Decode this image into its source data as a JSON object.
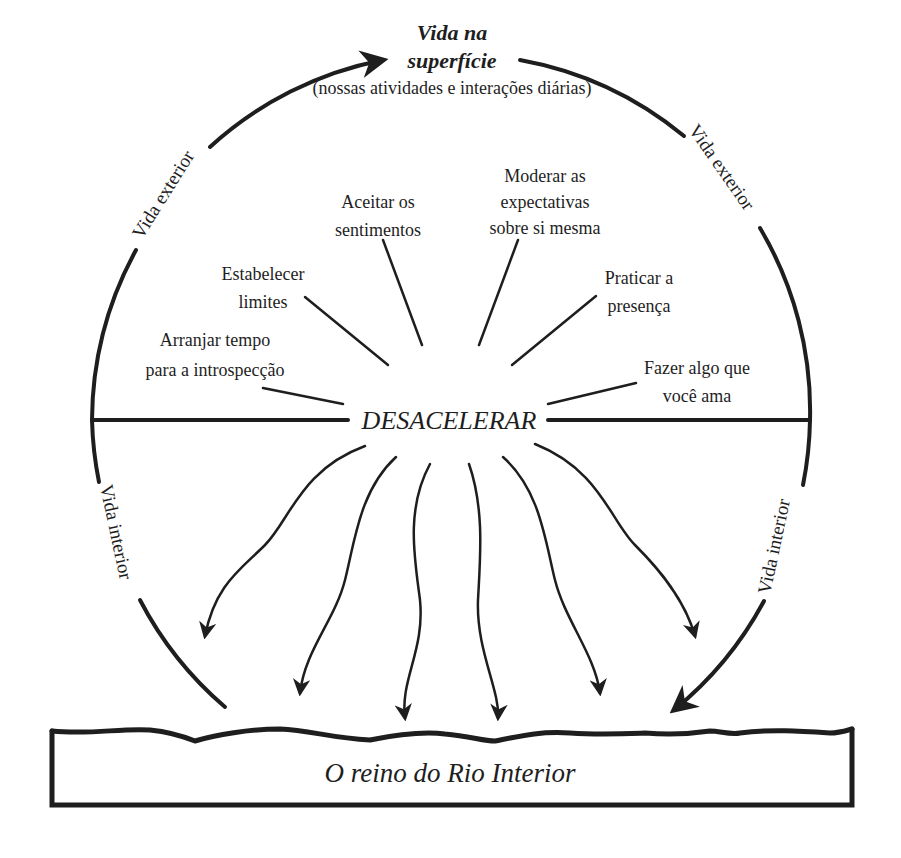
{
  "diagram": {
    "top_label": {
      "line1": "Vida na",
      "line2": "superfície",
      "subtitle": "(nossas atividades e interações diárias)"
    },
    "arc_labels": {
      "upper_left": "Vida exterior",
      "upper_right": "Vida exterior",
      "lower_left": "Vida interior",
      "lower_right": "Vida interior"
    },
    "center_label": "DESACELERAR",
    "practices": [
      {
        "id": "introspeccao",
        "lines": [
          "Arranjar tempo",
          "para a introspecção"
        ]
      },
      {
        "id": "limites",
        "lines": [
          "Estabelecer",
          "limites"
        ]
      },
      {
        "id": "sentimentos",
        "lines": [
          "Aceitar os",
          "sentimentos"
        ]
      },
      {
        "id": "expectativas",
        "lines": [
          "Moderar as",
          "expectativas",
          "sobre si mesma"
        ]
      },
      {
        "id": "presenca",
        "lines": [
          "Praticar a",
          "presença"
        ]
      },
      {
        "id": "fazer-algo",
        "lines": [
          "Fazer algo que",
          "você ama"
        ]
      }
    ],
    "bottom_box_label": "O reino do Rio Interior",
    "downward_arrow_count": 7
  }
}
